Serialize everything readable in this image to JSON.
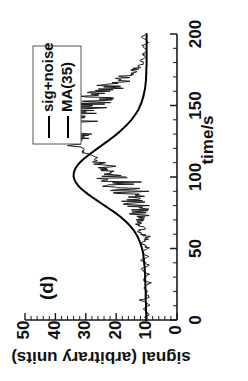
{
  "figure": {
    "panel_label": "(d)",
    "orientation": "rotated-90-ccw"
  },
  "legend": {
    "position": "top-left",
    "entries": [
      {
        "label": "sig+noise",
        "color": "#1b1b1b",
        "style": "thin-line"
      },
      {
        "label": "MA(35)",
        "color": "#000000",
        "style": "thick-line"
      }
    ]
  },
  "chart_data": {
    "type": "line",
    "title": "(d)",
    "xlabel": "time/s",
    "ylabel": "signal (arbitrary units)",
    "xlim": [
      0,
      200
    ],
    "ylim": [
      0,
      50
    ],
    "xticks": [
      0,
      50,
      100,
      150,
      200
    ],
    "yticks": [
      0,
      10,
      20,
      30,
      40,
      50
    ],
    "xtick_labels": [
      "0",
      "50",
      "100",
      "150",
      "200"
    ],
    "ytick_labels": [
      "0",
      "10",
      "20",
      "30",
      "40",
      "50"
    ],
    "x_minor_tick_step": 10,
    "y_minor_tick_step": 2,
    "grid": false,
    "legend_position": "upper left",
    "x": [
      0,
      2,
      4,
      6,
      8,
      10,
      12,
      14,
      16,
      18,
      20,
      22,
      24,
      26,
      28,
      30,
      32,
      34,
      36,
      38,
      40,
      42,
      44,
      46,
      48,
      50,
      52,
      54,
      56,
      58,
      60,
      62,
      64,
      66,
      68,
      70,
      72,
      74,
      76,
      78,
      80,
      82,
      84,
      86,
      88,
      90,
      92,
      94,
      96,
      98,
      100,
      102,
      104,
      106,
      108,
      110,
      112,
      114,
      116,
      118,
      120,
      122,
      124,
      126,
      128,
      130,
      132,
      134,
      136,
      138,
      140,
      142,
      144,
      146,
      148,
      150,
      152,
      154,
      156,
      158,
      160,
      162,
      164,
      166,
      168,
      170,
      172,
      174,
      176,
      178,
      180,
      182,
      184,
      186,
      188,
      190,
      192,
      194,
      196,
      198,
      200
    ],
    "series": [
      {
        "name": "sig+noise",
        "values": [
          9.8,
          10.6,
          8.9,
          10.2,
          11.4,
          9.1,
          10.0,
          11.8,
          8.6,
          10.4,
          9.5,
          11.0,
          10.1,
          8.8,
          11.5,
          10.3,
          9.2,
          10.9,
          11.7,
          9.4,
          10.2,
          12.1,
          9.0,
          10.7,
          11.3,
          9.6,
          10.5,
          11.9,
          10.0,
          9.3,
          11.2,
          12.4,
          10.6,
          11.1,
          12.8,
          11.5,
          10.9,
          12.3,
          13.6,
          12.0,
          13.1,
          14.5,
          13.2,
          15.0,
          16.4,
          15.1,
          17.3,
          18.9,
          17.6,
          19.8,
          21.5,
          20.3,
          22.8,
          24.6,
          23.4,
          25.9,
          27.8,
          26.5,
          29.1,
          31.4,
          30.2,
          32.6,
          34.9,
          33.1,
          35.8,
          34.2,
          36.4,
          35.1,
          33.8,
          35.6,
          34.0,
          32.5,
          33.9,
          31.2,
          29.6,
          30.8,
          28.1,
          26.4,
          27.3,
          24.8,
          23.1,
          21.6,
          22.4,
          19.8,
          18.3,
          17.1,
          15.6,
          14.2,
          13.4,
          12.1,
          11.3,
          12.0,
          10.4,
          11.2,
          9.8,
          10.6,
          11.1,
          9.5,
          10.2,
          11.4,
          10.0
        ]
      },
      {
        "name": "MA(35)",
        "values": [
          10.1,
          10.1,
          10.1,
          10.2,
          10.2,
          10.2,
          10.2,
          10.3,
          10.3,
          10.3,
          10.3,
          10.4,
          10.4,
          10.4,
          10.5,
          10.5,
          10.5,
          10.6,
          10.6,
          10.7,
          10.8,
          10.9,
          11.0,
          11.1,
          11.3,
          11.5,
          11.8,
          12.1,
          12.5,
          12.9,
          13.4,
          14.0,
          14.7,
          15.5,
          16.4,
          17.4,
          18.5,
          19.7,
          21.0,
          22.4,
          23.8,
          25.2,
          26.6,
          28.0,
          29.3,
          30.5,
          31.6,
          32.5,
          33.2,
          33.7,
          34.0,
          34.0,
          33.8,
          33.4,
          32.8,
          32.0,
          31.0,
          29.9,
          28.7,
          27.4,
          26.1,
          24.8,
          23.5,
          22.2,
          21.0,
          19.8,
          18.7,
          17.7,
          16.7,
          15.8,
          15.0,
          14.3,
          13.6,
          13.0,
          12.5,
          12.1,
          11.7,
          11.4,
          11.1,
          10.9,
          10.7,
          10.5,
          10.4,
          10.3,
          10.2,
          10.2,
          10.1,
          10.1,
          10.1,
          10.0,
          10.0,
          10.0,
          10.0,
          10.0,
          10.0,
          10.0,
          10.0,
          10.0,
          10.0,
          10.0,
          10.0
        ]
      }
    ]
  }
}
